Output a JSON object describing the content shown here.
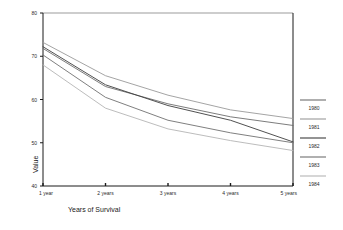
{
  "chart_data": {
    "type": "line",
    "title": "",
    "subtitle": "",
    "xlabel": "Years of Survival",
    "ylabel": "Value",
    "categories": [
      "1 year",
      "2 years",
      "3 years",
      "4 years",
      "5 years"
    ],
    "x": [
      1,
      2,
      3,
      4,
      5
    ],
    "xlim": [
      1,
      5
    ],
    "ylim": [
      40,
      80
    ],
    "yticks": [
      40,
      50,
      60,
      70,
      80
    ],
    "ytick_labels": [
      "40",
      "50",
      "60",
      "70",
      "80"
    ],
    "grid": false,
    "legend_position": "right",
    "series": [
      {
        "name": "1980",
        "color": "#6d6d6d",
        "values": [
          71.8,
          63.0,
          59.0,
          56.0,
          54.0
        ]
      },
      {
        "name": "1981",
        "color": "#9a9a9a",
        "values": [
          73.2,
          65.5,
          61.0,
          57.6,
          55.6
        ]
      },
      {
        "name": "1982",
        "color": "#3d3d3d",
        "values": [
          72.2,
          63.4,
          58.6,
          55.2,
          50.2
        ]
      },
      {
        "name": "1983",
        "color": "#707070",
        "values": [
          70.3,
          60.5,
          55.2,
          52.3,
          50.0
        ]
      },
      {
        "name": "1984",
        "color": "#b4b4b4",
        "values": [
          68.0,
          58.0,
          53.2,
          50.5,
          48.2
        ]
      }
    ]
  },
  "colors": {
    "axis": "#1a1a1a",
    "top_border": "#9b9b9b",
    "background": "#ffffff",
    "text": "#2b2b2b"
  },
  "legend": {
    "items": [
      {
        "label": "1980"
      },
      {
        "label": "1981"
      },
      {
        "label": "1982"
      },
      {
        "label": "1983"
      },
      {
        "label": "1984"
      }
    ]
  }
}
